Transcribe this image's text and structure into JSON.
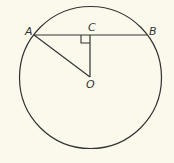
{
  "diagram": {
    "type": "geometry",
    "colors": {
      "background": "#fbf9ec",
      "stroke": "#333333"
    },
    "circle": {
      "center_label": "O",
      "cx": 90.5,
      "cy": 77.5,
      "r": 71
    },
    "points": {
      "A": {
        "label": "A",
        "x": 34,
        "y": 35
      },
      "B": {
        "label": "B",
        "x": 147,
        "y": 35
      },
      "C": {
        "label": "C",
        "x": 90,
        "y": 35
      },
      "O": {
        "label": "O",
        "x": 90,
        "y": 77
      }
    },
    "segments": [
      "AB",
      "CO",
      "AO"
    ],
    "annotations": [
      {
        "type": "right-angle",
        "at": "C"
      }
    ]
  }
}
